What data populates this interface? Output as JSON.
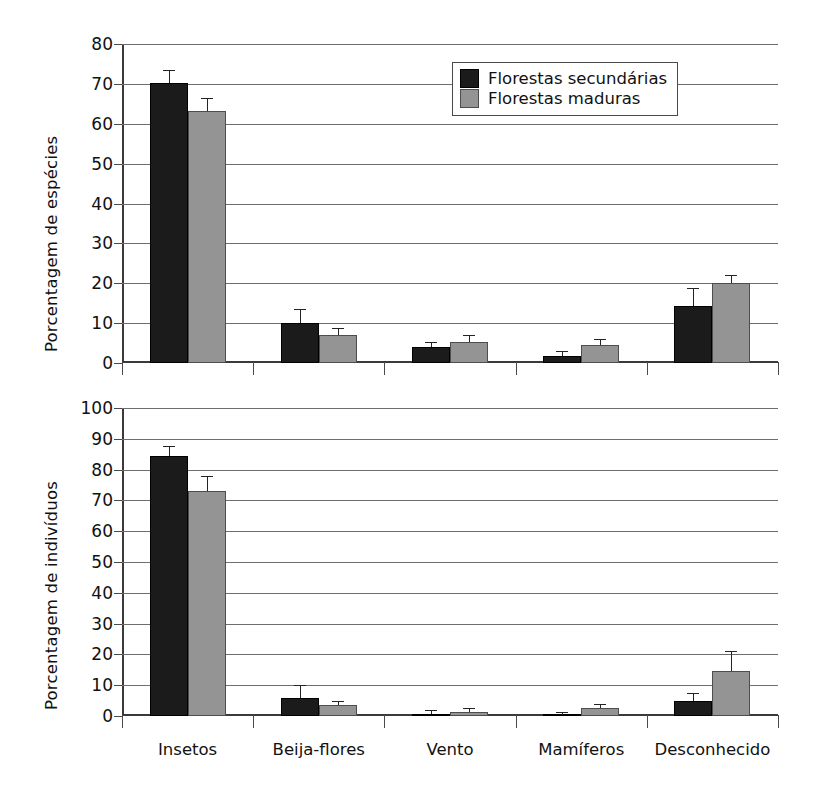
{
  "chart_data": [
    {
      "type": "bar",
      "id": "top",
      "title": "",
      "xlabel": "",
      "ylabel": "Porcentagem de espécies",
      "ylim": [
        0,
        80
      ],
      "ytick_step": 10,
      "yticks": [
        "0",
        "10",
        "20",
        "30",
        "40",
        "50",
        "60",
        "70",
        "80"
      ],
      "grid": true,
      "categories": [
        "Insetos",
        "Beija-flores",
        "Vento",
        "Mamíferos",
        "Desconhecido"
      ],
      "series": [
        {
          "name": "Florestas secundárias",
          "color": "#1b1b1b",
          "values": [
            70.2,
            10.0,
            4.0,
            1.8,
            14.4
          ],
          "errors": [
            3.3,
            3.5,
            1.3,
            1.1,
            4.4
          ]
        },
        {
          "name": "Florestas maduras",
          "color": "#949494",
          "values": [
            63.2,
            7.0,
            5.2,
            4.5,
            20.0
          ],
          "errors": [
            3.2,
            1.9,
            1.7,
            1.6,
            2.0
          ]
        }
      ]
    },
    {
      "type": "bar",
      "id": "bottom",
      "title": "",
      "xlabel": "",
      "ylabel": "Porcentagem de indivíduos",
      "ylim": [
        0,
        100
      ],
      "ytick_step": 10,
      "yticks": [
        "0",
        "10",
        "20",
        "30",
        "40",
        "50",
        "60",
        "70",
        "80",
        "90",
        "100"
      ],
      "grid": true,
      "categories": [
        "Insetos",
        "Beija-flores",
        "Vento",
        "Mamíferos",
        "Desconhecido"
      ],
      "series": [
        {
          "name": "Florestas secundárias",
          "color": "#1b1b1b",
          "values": [
            84.5,
            6.0,
            0.5,
            0.2,
            4.8
          ],
          "errors": [
            3.2,
            4.2,
            1.3,
            1.0,
            2.6
          ]
        },
        {
          "name": "Florestas maduras",
          "color": "#949494",
          "values": [
            73.0,
            3.5,
            1.2,
            2.5,
            14.5
          ],
          "errors": [
            5.0,
            1.5,
            1.5,
            1.3,
            6.5
          ]
        }
      ]
    }
  ],
  "legend": {
    "position": "top-right-inside-upper-chart",
    "entries": [
      {
        "label": "Florestas secundárias",
        "swatch": "dark"
      },
      {
        "label": "Florestas maduras",
        "swatch": "light"
      }
    ]
  }
}
